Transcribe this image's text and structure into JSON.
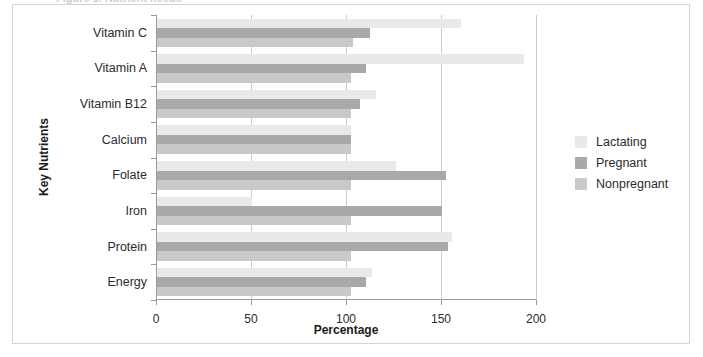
{
  "figure": {
    "top_caption_ghost": "Figure 1. Nutrient needs",
    "background": "#ffffff",
    "border_color": "#d4d4d4"
  },
  "chart_data": {
    "type": "bar",
    "orientation": "horizontal",
    "title": "",
    "xlabel": "Percentage",
    "ylabel": "Key Nutrients",
    "xlim": [
      0,
      200
    ],
    "xticks": [
      0,
      50,
      100,
      150,
      200
    ],
    "grid": "vertical",
    "legend_position": "right",
    "categories": [
      "Vitamin C",
      "Vitamin A",
      "Vitamin B12",
      "Calcium",
      "Folate",
      "Iron",
      "Protein",
      "Energy"
    ],
    "series": [
      {
        "name": "Lactating",
        "color": "#e9e9e9",
        "values": [
          160,
          193,
          115,
          102,
          126,
          50,
          155,
          113
        ]
      },
      {
        "name": "Pregnant",
        "color": "#a9a9a9",
        "values": [
          112,
          110,
          107,
          102,
          152,
          150,
          153,
          110
        ]
      },
      {
        "name": "Nonpregnant",
        "color": "#c9c9c9",
        "values": [
          103,
          102,
          102,
          102,
          102,
          102,
          102,
          102
        ]
      }
    ]
  }
}
